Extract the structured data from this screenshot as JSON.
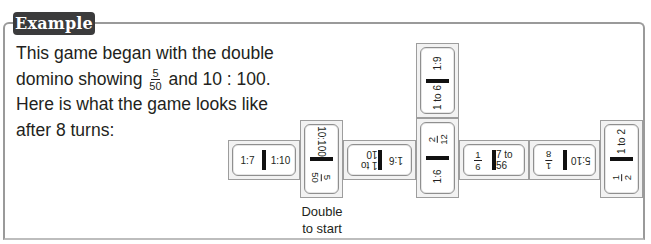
{
  "header": {
    "badge_label": "Example"
  },
  "intro": {
    "line1": "This game began with the double",
    "line2_prefix": "domino showing",
    "start_fraction": {
      "num": "5",
      "den": "50"
    },
    "line2_suffix": "and 10 : 100.",
    "line3": "Here is what the game looks like",
    "line4": "after 8 turns:"
  },
  "dominoes": [
    {
      "id": 1,
      "orientation": "horizontal",
      "a": "1:7",
      "b": "1:10"
    },
    {
      "id": 2,
      "orientation": "vertical",
      "double_start": true,
      "a": "10:100",
      "b": {
        "num": "5",
        "den": "50"
      }
    },
    {
      "id": 3,
      "orientation": "horizontal",
      "rotated": true,
      "a": "1 to 10",
      "b": "1:6"
    },
    {
      "id": 4,
      "orientation": "vertical",
      "a": "1:9",
      "b": "1 to 6"
    },
    {
      "id": 5,
      "orientation": "vertical",
      "a": {
        "num": "2",
        "den": "12"
      },
      "b": "1:6"
    },
    {
      "id": 6,
      "orientation": "horizontal",
      "a": {
        "num": "1",
        "den": "6"
      },
      "b": "7 to 56"
    },
    {
      "id": 7,
      "orientation": "horizontal",
      "rotated": true,
      "a": {
        "num": "1",
        "den": "8"
      },
      "b": "5:10"
    },
    {
      "id": 8,
      "orientation": "vertical",
      "a": "1 to 2",
      "b": {
        "num": "1",
        "den": "2"
      }
    }
  ],
  "caption": {
    "line1": "Double",
    "line2": "to start"
  }
}
